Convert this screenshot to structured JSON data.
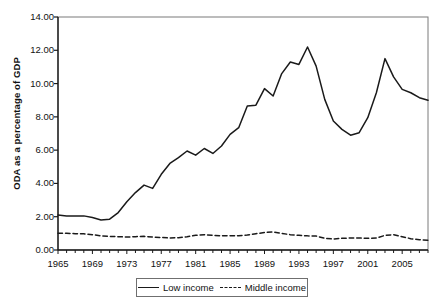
{
  "chart_data": {
    "type": "line",
    "title": "",
    "xlabel": "",
    "ylabel": "ODA as a percentage of GDP",
    "xlim": [
      1965,
      2008
    ],
    "ylim": [
      0.0,
      14.0
    ],
    "grid": false,
    "legend_position": "bottom-center",
    "y_ticks": [
      "0.00",
      "2.00",
      "4.00",
      "6.00",
      "8.00",
      "10.00",
      "12.00",
      "14.00"
    ],
    "y_tick_values": [
      0.0,
      2.0,
      4.0,
      6.0,
      8.0,
      10.0,
      12.0,
      14.0
    ],
    "x_ticks": [
      "1965",
      "1969",
      "1973",
      "1977",
      "1981",
      "1985",
      "1989",
      "1993",
      "1997",
      "2001",
      "2005"
    ],
    "x_tick_values": [
      1965,
      1969,
      1973,
      1977,
      1981,
      1985,
      1989,
      1993,
      1997,
      2001,
      2005
    ],
    "x": [
      1965,
      1966,
      1967,
      1968,
      1969,
      1970,
      1971,
      1972,
      1973,
      1974,
      1975,
      1976,
      1977,
      1978,
      1979,
      1980,
      1981,
      1982,
      1983,
      1984,
      1985,
      1986,
      1987,
      1988,
      1989,
      1990,
      1991,
      1992,
      1993,
      1994,
      1995,
      1996,
      1997,
      1998,
      1999,
      2000,
      2001,
      2002,
      2003,
      2004,
      2005,
      2006,
      2007,
      2008
    ],
    "series": [
      {
        "name": "Low income",
        "style": "solid",
        "color": "#1a1a1a",
        "values": [
          2.1,
          2.05,
          2.05,
          2.05,
          1.95,
          1.8,
          1.85,
          2.25,
          2.9,
          3.45,
          3.9,
          3.7,
          4.55,
          5.2,
          5.55,
          5.95,
          5.7,
          6.1,
          5.8,
          6.25,
          6.95,
          7.35,
          8.65,
          8.7,
          9.7,
          9.25,
          10.6,
          11.3,
          11.15,
          12.2,
          11.05,
          9.05,
          7.75,
          7.25,
          6.9,
          7.05,
          7.95,
          9.45,
          11.5,
          10.4,
          9.65,
          9.45,
          9.15,
          9.0
        ]
      },
      {
        "name": "Middle income",
        "style": "dashed",
        "color": "#1a1a1a",
        "values": [
          1.0,
          1.0,
          0.98,
          0.97,
          0.92,
          0.85,
          0.82,
          0.8,
          0.78,
          0.8,
          0.82,
          0.78,
          0.75,
          0.72,
          0.74,
          0.8,
          0.88,
          0.92,
          0.88,
          0.85,
          0.85,
          0.86,
          0.9,
          0.98,
          1.05,
          1.08,
          1.0,
          0.92,
          0.88,
          0.85,
          0.84,
          0.7,
          0.66,
          0.7,
          0.72,
          0.72,
          0.7,
          0.72,
          0.88,
          0.92,
          0.8,
          0.68,
          0.62,
          0.58
        ]
      }
    ],
    "legend": [
      {
        "label": "Low income",
        "style": "solid"
      },
      {
        "label": "Middle income",
        "style": "dashed"
      }
    ]
  }
}
